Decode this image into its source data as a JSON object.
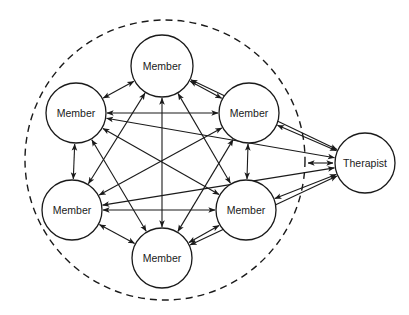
{
  "diagram": {
    "type": "communication-network",
    "colors": {
      "stroke": "#1a1a1a",
      "background": "#ffffff"
    },
    "group_boundary": {
      "style": "dashed",
      "cx": 165,
      "cy": 160,
      "r": 140
    },
    "nodes": [
      {
        "id": "m_top",
        "label": "Member",
        "cx": 162,
        "cy": 66,
        "r": 31
      },
      {
        "id": "m_ul",
        "label": "Member",
        "cx": 76,
        "cy": 113,
        "r": 30
      },
      {
        "id": "m_ur",
        "label": "Member",
        "cx": 249,
        "cy": 113,
        "r": 30
      },
      {
        "id": "m_ll",
        "label": "Member",
        "cx": 72,
        "cy": 210,
        "r": 30
      },
      {
        "id": "m_lr",
        "label": "Member",
        "cx": 246,
        "cy": 210,
        "r": 30
      },
      {
        "id": "m_bot",
        "label": "Member",
        "cx": 162,
        "cy": 258,
        "r": 30
      },
      {
        "id": "therapist",
        "label": "Therapist",
        "cx": 365,
        "cy": 163,
        "r": 30
      }
    ],
    "edges": [
      {
        "from": "m_top",
        "to": "m_ul",
        "bidirectional": true
      },
      {
        "from": "m_top",
        "to": "m_ur",
        "bidirectional": true
      },
      {
        "from": "m_top",
        "to": "m_bot",
        "bidirectional": true
      },
      {
        "from": "m_top",
        "to": "m_ll",
        "bidirectional": true
      },
      {
        "from": "m_top",
        "to": "m_lr",
        "bidirectional": true
      },
      {
        "from": "m_top",
        "to": "therapist",
        "bidirectional": true
      },
      {
        "from": "m_ul",
        "to": "m_ur",
        "bidirectional": true
      },
      {
        "from": "m_ul",
        "to": "m_ll",
        "bidirectional": true
      },
      {
        "from": "m_ul",
        "to": "m_lr",
        "bidirectional": true
      },
      {
        "from": "m_ul",
        "to": "m_bot",
        "bidirectional": true
      },
      {
        "from": "m_ul",
        "to": "therapist",
        "bidirectional": true
      },
      {
        "from": "m_ur",
        "to": "m_ll",
        "bidirectional": true
      },
      {
        "from": "m_ur",
        "to": "m_lr",
        "bidirectional": true
      },
      {
        "from": "m_ur",
        "to": "m_bot",
        "bidirectional": true
      },
      {
        "from": "m_ur",
        "to": "therapist",
        "bidirectional": true
      },
      {
        "from": "m_ll",
        "to": "m_lr",
        "bidirectional": true
      },
      {
        "from": "m_ll",
        "to": "m_bot",
        "bidirectional": true
      },
      {
        "from": "m_ll",
        "to": "therapist",
        "bidirectional": true
      },
      {
        "from": "m_lr",
        "to": "m_bot",
        "bidirectional": true
      },
      {
        "from": "m_lr",
        "to": "therapist",
        "bidirectional": true
      },
      {
        "from": "m_bot",
        "to": "therapist",
        "bidirectional": true
      }
    ],
    "extra_marks": [
      {
        "note": "short double-headed arrow near therapist inside dashed boundary",
        "x1": 308,
        "y1": 163,
        "x2": 333,
        "y2": 163
      }
    ]
  }
}
